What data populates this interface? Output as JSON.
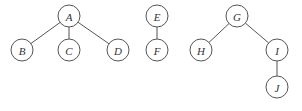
{
  "diagram": {
    "type": "forest",
    "trees": [
      {
        "root": "A",
        "nodes": [
          {
            "id": "A",
            "label": "A",
            "x": 69,
            "y": 16
          },
          {
            "id": "B",
            "label": "B",
            "x": 22,
            "y": 50
          },
          {
            "id": "C",
            "label": "C",
            "x": 69,
            "y": 50
          },
          {
            "id": "D",
            "label": "D",
            "x": 118,
            "y": 50
          }
        ],
        "edges": [
          [
            "A",
            "B"
          ],
          [
            "A",
            "C"
          ],
          [
            "A",
            "D"
          ]
        ]
      },
      {
        "root": "E",
        "nodes": [
          {
            "id": "E",
            "label": "E",
            "x": 157,
            "y": 16
          },
          {
            "id": "F",
            "label": "F",
            "x": 157,
            "y": 50
          }
        ],
        "edges": [
          [
            "E",
            "F"
          ]
        ]
      },
      {
        "root": "G",
        "nodes": [
          {
            "id": "G",
            "label": "G",
            "x": 237,
            "y": 16
          },
          {
            "id": "H",
            "label": "H",
            "x": 201,
            "y": 50
          },
          {
            "id": "I",
            "label": "I",
            "x": 277,
            "y": 50
          },
          {
            "id": "J",
            "label": "J",
            "x": 277,
            "y": 87
          }
        ],
        "edges": [
          [
            "G",
            "H"
          ],
          [
            "G",
            "I"
          ],
          [
            "I",
            "J"
          ]
        ]
      }
    ],
    "node_radius": 11,
    "colors": {
      "stroke": "#555555",
      "text": "#333333",
      "fill": "#ffffff"
    }
  }
}
